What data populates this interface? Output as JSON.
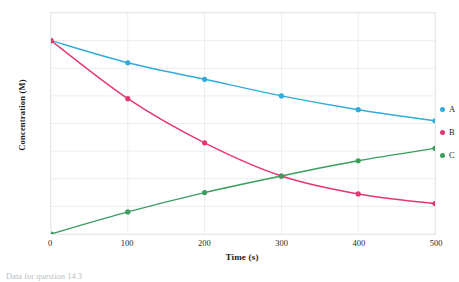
{
  "chart_data": {
    "type": "line",
    "title": "",
    "xlabel": "Time (s)",
    "ylabel": "Concentration (M)",
    "x": [
      0,
      100,
      200,
      300,
      400,
      500
    ],
    "xlim": [
      0,
      500
    ],
    "ylim": [
      0,
      0.08
    ],
    "xticks": [
      "0",
      "100",
      "200",
      "300",
      "400",
      "500"
    ],
    "yticks": [
      "0",
      "0.01",
      "0.02",
      "0.03",
      "0.04",
      "0.05",
      "0.06",
      "0.07",
      "0.08"
    ],
    "ytick_values": [
      0,
      0.01,
      0.02,
      0.03,
      0.04,
      0.05,
      0.06,
      0.07,
      0.08
    ],
    "grid": true,
    "legend_position": "right",
    "markers": "circle",
    "series": [
      {
        "name": "A",
        "color": "#31ABDC",
        "values": [
          0.07,
          0.062,
          0.056,
          0.05,
          0.045,
          0.041
        ]
      },
      {
        "name": "B",
        "color": "#E4386E",
        "values": [
          0.07,
          0.049,
          0.033,
          0.021,
          0.0145,
          0.011
        ]
      },
      {
        "name": "C",
        "color": "#3A9E5F",
        "values": [
          0.0,
          0.008,
          0.015,
          0.021,
          0.0265,
          0.031
        ]
      }
    ]
  },
  "caption": {
    "text": "Data for question 14.3"
  }
}
